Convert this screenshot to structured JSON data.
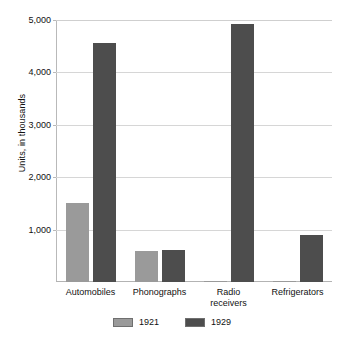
{
  "chart_data": {
    "type": "bar",
    "title": "",
    "subtitle": "",
    "xlabel": "",
    "ylabel": "Units, in thousands",
    "categories": [
      "Automobiles",
      "Phonographs",
      "Radio\nreceivers",
      "Refrigerators"
    ],
    "series": [
      {
        "name": "1921",
        "color": "#9a9a9a",
        "values": [
          1500,
          600,
          5,
          10
        ]
      },
      {
        "name": "1929",
        "color": "#4d4d4d",
        "values": [
          4560,
          610,
          4930,
          890
        ]
      }
    ],
    "ylim": [
      0,
      5000
    ],
    "yticks": [
      1000,
      2000,
      3000,
      4000,
      5000
    ],
    "ytick_labels": [
      "1,000",
      "2,000",
      "3,000",
      "4,000",
      "5,000"
    ],
    "grid": true,
    "legend_position": "bottom",
    "legend_entries": [
      {
        "label": "1921",
        "color": "#9a9a9a"
      },
      {
        "label": "1929",
        "color": "#4d4d4d"
      }
    ]
  }
}
